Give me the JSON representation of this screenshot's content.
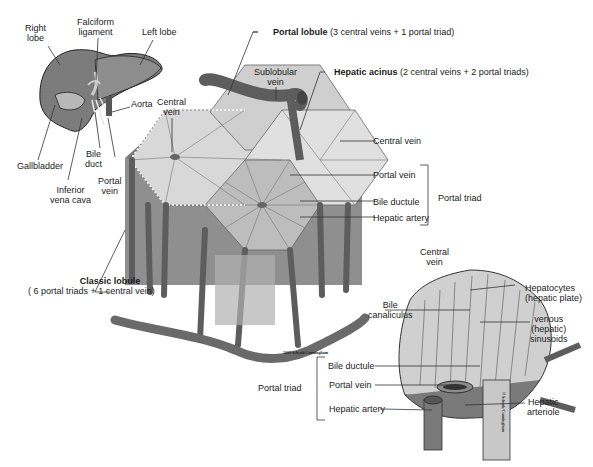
{
  "figure": {
    "copyright": "2009 Schenk/Cunningham",
    "copyright_vertical": "© Schenk/Cunningham"
  },
  "liver_inset": {
    "labels": {
      "right_lobe": "Right\nlobe",
      "falciform_ligament": "Falciform\nligament",
      "left_lobe": "Left lobe",
      "aorta": "Aorta",
      "gallbladder": "Gallbladder",
      "bile_duct": "Bile\nduct",
      "inferior_vena_cava": "Inferior\nvena cava",
      "portal_vein": "Portal\nvein"
    }
  },
  "lobule_block": {
    "labels": {
      "central_vein_top": "Central\nvein",
      "sublobular_vein": "Sublobular\nvein",
      "portal_lobule_bold": "Portal lobule",
      "portal_lobule_desc": " (3 central veins + 1 portal triad)",
      "hepatic_acinus_bold": "Hepatic acinus",
      "hepatic_acinus_desc": " (2 central veins + 2 portal triads)",
      "central_vein_right": "Central vein",
      "portal_vein": "Portal vein",
      "bile_ductule": "Bile ductule",
      "hepatic_artery": "Hepatic artery",
      "portal_triad_bracket": "Portal triad",
      "classic_lobule_bold": "Classic lobule",
      "classic_lobule_desc": "( 6 portal triads + 1 central vein)"
    }
  },
  "microscopic_detail": {
    "labels": {
      "central_vein": "Central\nvein",
      "hepatocytes": "Hepatocytes\n(hepatic plate)",
      "bile_canaliculus": "Bile\ncanaliculus",
      "venous_sinusoids": "venous\n(hepatic)\nsinusoids",
      "bile_ductule": "Bile ductule",
      "portal_vein": "Portal vein",
      "hepatic_artery": "Hepatic artery",
      "portal_triad": "Portal triad",
      "hepatic_arteriole": "Hepatic\narteriole"
    }
  },
  "colors": {
    "liver_dark": "#6e6e6e",
    "liver_mid": "#8a8a8a",
    "hexagon_light": "#d9d9d9",
    "block_side": "#9a9a9a",
    "vessel": "#5d5d5d",
    "leader_line": "#333333"
  }
}
